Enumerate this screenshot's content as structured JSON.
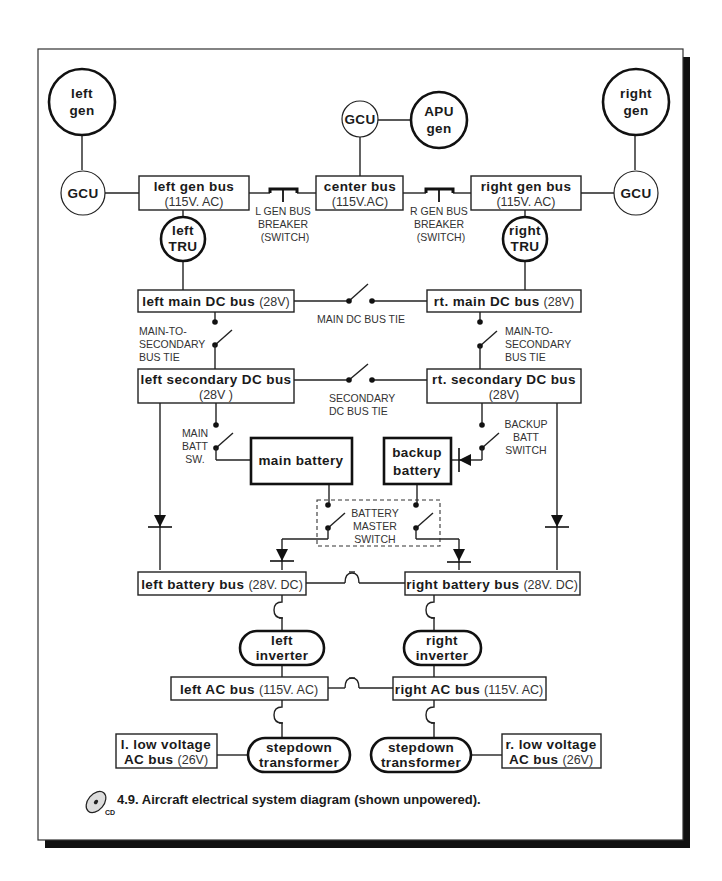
{
  "figure": {
    "caption": "4.9.  Aircraft electrical system diagram (shown unpowered).",
    "cd_icon_label": "CD",
    "accent_colors": {
      "ink": "#1a1a1a",
      "frame_shadow": "#111111",
      "background": "#ffffff"
    }
  },
  "generators": {
    "left_gen": [
      "left",
      "gen"
    ],
    "right_gen": [
      "right",
      "gen"
    ],
    "apu_gen": [
      "APU",
      "gen"
    ]
  },
  "gcu": {
    "left": "GCU",
    "center": "GCU",
    "right": "GCU"
  },
  "buses": {
    "left_gen_bus": {
      "name": "left gen bus",
      "voltage": "(115V. AC)"
    },
    "center_bus": {
      "name": "center bus",
      "voltage": "(115V.AC)"
    },
    "right_gen_bus": {
      "name": "right gen bus",
      "voltage": "(115V. AC)"
    },
    "left_main_dc": {
      "name": "left main DC bus",
      "voltage": "(28V)"
    },
    "rt_main_dc": {
      "name": "rt. main DC bus",
      "voltage": "(28V)"
    },
    "left_secondary_dc": {
      "name": "left secondary DC bus",
      "voltage": "(28V )"
    },
    "rt_secondary_dc": {
      "name": "rt. secondary DC bus",
      "voltage": "(28V)"
    },
    "left_battery": {
      "name": "left battery bus",
      "voltage": "(28V. DC)"
    },
    "right_battery": {
      "name": "right battery bus",
      "voltage": "(28V. DC)"
    },
    "left_ac": {
      "name": "left AC bus",
      "voltage": "(115V. AC)"
    },
    "right_ac": {
      "name": "right AC bus",
      "voltage": "(115V. AC)"
    },
    "l_low_voltage": {
      "name1": "l. low voltage",
      "name2": "AC bus",
      "voltage": "(26V)"
    },
    "r_low_voltage": {
      "name1": "r. low voltage",
      "name2": "AC bus",
      "voltage": "(26V)"
    }
  },
  "components": {
    "left_tru": [
      "left",
      "TRU"
    ],
    "right_tru": [
      "right",
      "TRU"
    ],
    "main_battery": "main battery",
    "backup_battery": [
      "backup",
      "battery"
    ],
    "left_inverter": [
      "left",
      "inverter"
    ],
    "right_inverter": [
      "right",
      "inverter"
    ],
    "left_stepdown": [
      "stepdown",
      "transformer"
    ],
    "right_stepdown": [
      "stepdown",
      "transformer"
    ]
  },
  "switch_labels": {
    "l_gen_bus_breaker": [
      "L GEN BUS",
      "BREAKER",
      "(SWITCH)"
    ],
    "r_gen_bus_breaker": [
      "R GEN BUS",
      "BREAKER",
      "(SWITCH)"
    ],
    "main_dc_bus_tie": "MAIN DC BUS TIE",
    "left_main_to_secondary": [
      "MAIN-TO-",
      "SECONDARY",
      "BUS TIE"
    ],
    "right_main_to_secondary": [
      "MAIN-TO-",
      "SECONDARY",
      "BUS TIE"
    ],
    "secondary_dc_bus_tie": [
      "SECONDARY",
      "DC  BUS TIE"
    ],
    "main_batt_sw": [
      "MAIN",
      "BATT",
      "SW."
    ],
    "backup_batt_switch": [
      "BACKUP",
      "BATT",
      "SWITCH"
    ],
    "battery_master_switch": [
      "BATTERY",
      "MASTER",
      "SWITCH"
    ]
  }
}
